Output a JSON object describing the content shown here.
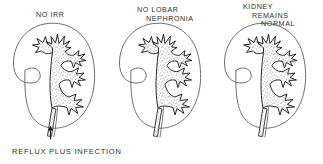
{
  "figure": {
    "type": "medical-line-diagram",
    "background_color": "#ffffff",
    "ink_color": "#222222",
    "outline_color": "#6a6a6a",
    "stipple_color": "#3a3a3a",
    "panel_count": 3
  },
  "panels": [
    {
      "id": "panel-1",
      "label_lines": [
        "NO IRR"
      ],
      "has_reflux_arrow": true,
      "stagger": false
    },
    {
      "id": "panel-2",
      "label_lines": [
        "NO LOBAR",
        "NEPHRONIA"
      ],
      "has_reflux_arrow": false,
      "stagger": true
    },
    {
      "id": "panel-3",
      "label_lines": [
        "KIDNEY",
        "REMAINS",
        "NORMAL"
      ],
      "has_reflux_arrow": false,
      "stagger": true
    }
  ],
  "caption": {
    "text": "REFLUX PLUS INFECTION"
  },
  "icons": {
    "reflux_arrow": "arrow-up-icon",
    "kidney": "kidney-outline-icon",
    "calyx": "calyx-star-icon"
  }
}
